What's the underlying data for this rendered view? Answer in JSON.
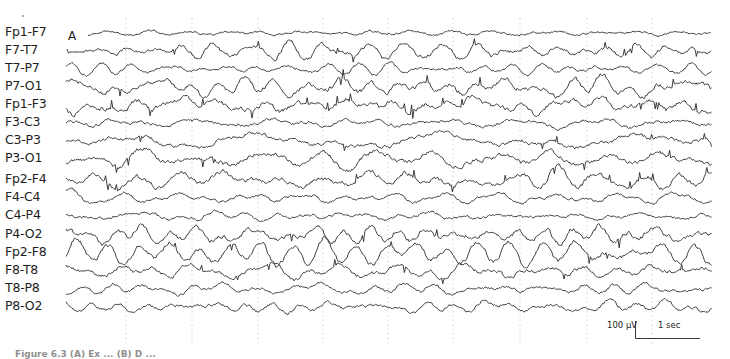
{
  "figure": {
    "panel_letter": "A",
    "caption_visible_fragment": "Figure 6.3   (A) Ex ... (B) D ...",
    "scale_bar": {
      "amplitude_label": "100 µV",
      "time_label": "1 sec"
    },
    "gridlines_x": [
      126,
      192,
      258,
      323,
      388,
      453,
      520,
      587,
      652
    ],
    "trace_x_range": [
      66,
      712
    ],
    "colors": {
      "trace": "#2a2a2a",
      "grid": "#c8c8c8",
      "label": "#1e1e1e"
    }
  },
  "channels": [
    {
      "label": "Fp1-F7",
      "y": 33,
      "amp": 2.2,
      "start": 88,
      "seed": 11
    },
    {
      "label": "F7-T7",
      "y": 51,
      "amp": 6.5,
      "start": 70,
      "seed": 23
    },
    {
      "label": "T7-P7",
      "y": 69,
      "amp": 3.5,
      "start": 66,
      "seed": 37
    },
    {
      "label": "P7-O1",
      "y": 87,
      "amp": 8.0,
      "start": 66,
      "seed": 41
    },
    {
      "label": "Fp1-F3",
      "y": 105,
      "amp": 8.0,
      "start": 66,
      "seed": 53
    },
    {
      "label": "F3-C3",
      "y": 123,
      "amp": 4.5,
      "start": 66,
      "seed": 67
    },
    {
      "label": "C3-P3",
      "y": 141,
      "amp": 6.0,
      "start": 66,
      "seed": 71
    },
    {
      "label": "P3-O1",
      "y": 159,
      "amp": 7.5,
      "start": 66,
      "seed": 83
    },
    {
      "label": "Fp2-F4",
      "y": 180,
      "amp": 7.5,
      "start": 66,
      "seed": 97
    },
    {
      "label": "F4-C4",
      "y": 198,
      "amp": 4.0,
      "start": 66,
      "seed": 101
    },
    {
      "label": "C4-P4",
      "y": 216,
      "amp": 4.0,
      "start": 66,
      "seed": 113
    },
    {
      "label": "P4-O2",
      "y": 235,
      "amp": 8.5,
      "start": 66,
      "seed": 127
    },
    {
      "label": "Fp2-F8",
      "y": 253,
      "amp": 7.5,
      "start": 66,
      "seed": 131
    },
    {
      "label": "F8-T8",
      "y": 271,
      "amp": 6.0,
      "start": 66,
      "seed": 149
    },
    {
      "label": "T8-P8",
      "y": 289,
      "amp": 4.0,
      "start": 66,
      "seed": 157
    },
    {
      "label": "P8-O2",
      "y": 307,
      "amp": 4.5,
      "start": 66,
      "seed": 163
    }
  ]
}
